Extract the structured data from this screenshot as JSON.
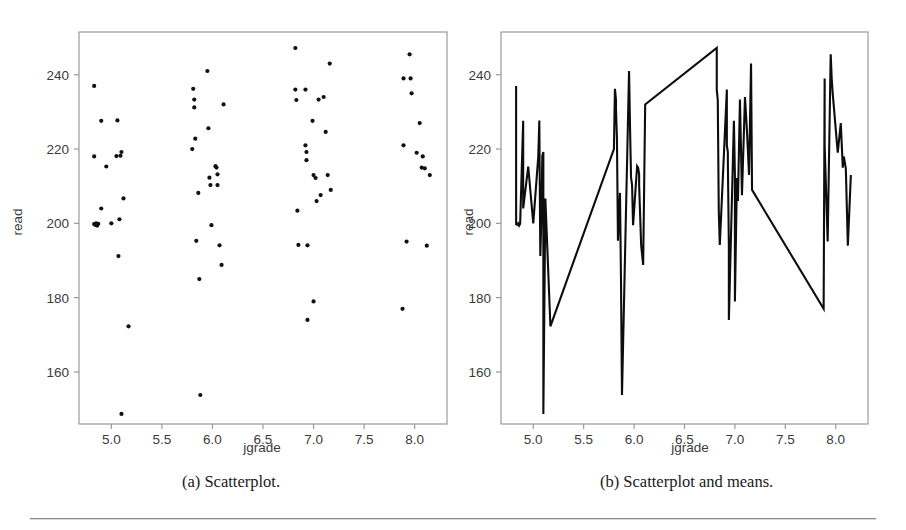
{
  "figure": {
    "panels": [
      {
        "id": "a",
        "caption": "(a) Scatterplot.",
        "xlabel": "jgrade",
        "ylabel": "read"
      },
      {
        "id": "b",
        "caption": "(b) Scatterplot and means.",
        "xlabel": "jgrade",
        "ylabel": "read"
      }
    ],
    "colors": {
      "frame": "#9a9a9a",
      "marker": "#111111",
      "line": "#0d0d0d",
      "text": "#3b3b3b",
      "background": "#ffffff",
      "rule": "#8d8d8d"
    }
  },
  "chart_data": [
    {
      "type": "scatter",
      "title": "(a) Scatterplot.",
      "xlabel": "jgrade",
      "ylabel": "read",
      "xlim": [
        4.68,
        8.32
      ],
      "ylim": [
        146.0,
        251.5
      ],
      "xticks": [
        5.0,
        5.5,
        6.0,
        6.5,
        7.0,
        7.5,
        8.0
      ],
      "xticklabels": [
        "5.0",
        "5.5",
        "6.0",
        "6.5",
        "7.0",
        "7.5",
        "8.0"
      ],
      "yticks": [
        160,
        180,
        200,
        220,
        240
      ],
      "yticklabels": [
        "160",
        "180",
        "200",
        "220",
        "240"
      ],
      "grid": false,
      "legend": false,
      "points": [
        [
          4.83,
          237.0
        ],
        [
          4.83,
          218.0
        ],
        [
          4.83,
          199.8
        ],
        [
          4.84,
          199.6
        ],
        [
          4.85,
          200.0
        ],
        [
          4.86,
          199.4
        ],
        [
          4.87,
          199.9
        ],
        [
          4.9,
          227.6
        ],
        [
          4.9,
          204.0
        ],
        [
          4.95,
          215.3
        ],
        [
          5.0,
          200.0
        ],
        [
          5.05,
          218.1
        ],
        [
          5.06,
          227.7
        ],
        [
          5.07,
          191.2
        ],
        [
          5.08,
          201.1
        ],
        [
          5.09,
          218.2
        ],
        [
          5.1,
          219.2
        ],
        [
          5.1,
          148.7
        ],
        [
          5.12,
          206.7
        ],
        [
          5.17,
          172.3
        ],
        [
          5.8,
          220.0
        ],
        [
          5.81,
          236.2
        ],
        [
          5.82,
          233.3
        ],
        [
          5.82,
          231.2
        ],
        [
          5.83,
          222.8
        ],
        [
          5.84,
          195.3
        ],
        [
          5.86,
          208.2
        ],
        [
          5.87,
          185.0
        ],
        [
          5.88,
          153.8
        ],
        [
          5.95,
          241.0
        ],
        [
          5.96,
          225.6
        ],
        [
          5.97,
          212.3
        ],
        [
          5.98,
          210.3
        ],
        [
          5.99,
          199.5
        ],
        [
          6.03,
          215.4
        ],
        [
          6.04,
          215.0
        ],
        [
          6.05,
          213.2
        ],
        [
          6.05,
          210.3
        ],
        [
          6.07,
          194.1
        ],
        [
          6.09,
          188.8
        ],
        [
          6.11,
          232.0
        ],
        [
          6.82,
          247.2
        ],
        [
          6.82,
          236.0
        ],
        [
          6.83,
          233.2
        ],
        [
          6.84,
          203.4
        ],
        [
          6.85,
          194.2
        ],
        [
          6.92,
          236.0
        ],
        [
          6.92,
          221.0
        ],
        [
          6.93,
          219.2
        ],
        [
          6.93,
          217.0
        ],
        [
          6.94,
          194.1
        ],
        [
          6.94,
          174.0
        ],
        [
          6.99,
          227.6
        ],
        [
          7.0,
          213.0
        ],
        [
          7.0,
          179.0
        ],
        [
          7.02,
          212.2
        ],
        [
          7.03,
          206.0
        ],
        [
          7.05,
          233.3
        ],
        [
          7.07,
          207.6
        ],
        [
          7.1,
          234.0
        ],
        [
          7.12,
          224.6
        ],
        [
          7.14,
          213.0
        ],
        [
          7.16,
          243.0
        ],
        [
          7.17,
          209.0
        ],
        [
          7.88,
          177.0
        ],
        [
          7.89,
          239.0
        ],
        [
          7.89,
          221.0
        ],
        [
          7.92,
          195.1
        ],
        [
          7.95,
          245.5
        ],
        [
          7.96,
          239.0
        ],
        [
          7.97,
          235.0
        ],
        [
          8.02,
          219.0
        ],
        [
          8.05,
          227.0
        ],
        [
          8.07,
          215.0
        ],
        [
          8.08,
          218.0
        ],
        [
          8.1,
          214.8
        ],
        [
          8.12,
          194.0
        ],
        [
          8.15,
          213.0
        ]
      ]
    },
    {
      "type": "line",
      "title": "(b) Scatterplot and means.",
      "xlabel": "jgrade",
      "ylabel": "read",
      "xlim": [
        4.68,
        8.32
      ],
      "ylim": [
        146.0,
        251.5
      ],
      "xticks": [
        5.0,
        5.5,
        6.0,
        6.5,
        7.0,
        7.5,
        8.0
      ],
      "xticklabels": [
        "5.0",
        "5.5",
        "6.0",
        "6.5",
        "7.0",
        "7.5",
        "8.0"
      ],
      "yticks": [
        160,
        180,
        200,
        220,
        240
      ],
      "yticklabels": [
        "160",
        "180",
        "200",
        "220",
        "240"
      ],
      "grid": false,
      "legend": false,
      "note": "Same observations as panel (a), connected in x-order by a polyline through the sorted points.",
      "x": [
        4.83,
        4.83,
        4.83,
        4.84,
        4.85,
        4.86,
        4.87,
        4.9,
        4.9,
        4.95,
        5.0,
        5.05,
        5.06,
        5.07,
        5.08,
        5.09,
        5.1,
        5.1,
        5.12,
        5.17,
        5.8,
        5.81,
        5.82,
        5.82,
        5.83,
        5.84,
        5.86,
        5.87,
        5.88,
        5.95,
        5.96,
        5.97,
        5.98,
        5.99,
        6.03,
        6.04,
        6.05,
        6.05,
        6.07,
        6.09,
        6.11,
        6.82,
        6.82,
        6.83,
        6.84,
        6.85,
        6.92,
        6.92,
        6.93,
        6.93,
        6.94,
        6.94,
        6.99,
        7.0,
        7.0,
        7.02,
        7.03,
        7.05,
        7.07,
        7.1,
        7.12,
        7.14,
        7.16,
        7.17,
        7.88,
        7.89,
        7.89,
        7.92,
        7.95,
        7.96,
        7.97,
        8.02,
        8.05,
        8.07,
        8.08,
        8.1,
        8.12,
        8.15
      ],
      "y": [
        237.0,
        218.0,
        199.8,
        199.6,
        200.0,
        199.4,
        199.9,
        227.6,
        204.0,
        215.3,
        200.0,
        218.1,
        227.7,
        191.2,
        201.1,
        218.2,
        219.2,
        148.7,
        206.7,
        172.3,
        220.0,
        236.2,
        233.3,
        231.2,
        222.8,
        195.3,
        208.2,
        185.0,
        153.8,
        241.0,
        225.6,
        212.3,
        210.3,
        199.5,
        215.4,
        215.0,
        213.2,
        210.3,
        194.1,
        188.8,
        232.0,
        247.2,
        236.0,
        233.2,
        203.4,
        194.2,
        236.0,
        221.0,
        219.2,
        217.0,
        194.1,
        174.0,
        227.6,
        213.0,
        179.0,
        212.2,
        206.0,
        233.3,
        207.6,
        234.0,
        224.6,
        213.0,
        243.0,
        209.0,
        177.0,
        239.0,
        221.0,
        195.1,
        245.5,
        239.0,
        235.0,
        219.0,
        227.0,
        215.0,
        218.0,
        214.8,
        194.0,
        213.0
      ],
      "means_segment": {
        "description": "Flat high connector from jgrade 7.17 to 7.88 near read 242",
        "x": [
          7.17,
          7.88
        ],
        "y": [
          243.0,
          239.0
        ]
      }
    }
  ]
}
